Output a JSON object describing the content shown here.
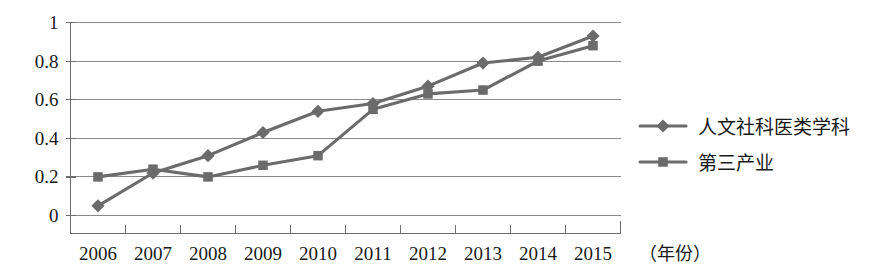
{
  "chart_data": {
    "type": "line",
    "title": "",
    "xlabel": "（年份）",
    "ylabel": "",
    "categories": [
      "2006",
      "2007",
      "2008",
      "2009",
      "2010",
      "2011",
      "2012",
      "2013",
      "2014",
      "2015"
    ],
    "series": [
      {
        "name": "人文社科医类学科",
        "marker": "diamond",
        "color": "#6b6b6b",
        "values": [
          0.05,
          0.22,
          0.31,
          0.43,
          0.54,
          0.58,
          0.67,
          0.79,
          0.82,
          0.93
        ]
      },
      {
        "name": "第三产业",
        "marker": "square",
        "color": "#6b6b6b",
        "values": [
          0.2,
          0.24,
          0.2,
          0.26,
          0.31,
          0.55,
          0.63,
          0.65,
          0.8,
          0.88
        ]
      }
    ],
    "ylim": [
      0,
      1
    ],
    "yticks": [
      "0",
      "0.2",
      "0.4",
      "0.6",
      "0.8",
      "1"
    ],
    "ytick_values": [
      0,
      0.2,
      0.4,
      0.6,
      0.8,
      1
    ],
    "grid": true,
    "legend_position": "right"
  },
  "legend": {
    "entries": [
      {
        "label": "人文社科医类学科",
        "marker": "diamond"
      },
      {
        "label": "第三产业",
        "marker": "square"
      }
    ]
  },
  "colors": {
    "series": "#6b6b6b",
    "gridline": "#8a8a8a",
    "axis": "#6e6e6e",
    "text": "#1a1a1a",
    "background": "#ffffff"
  }
}
